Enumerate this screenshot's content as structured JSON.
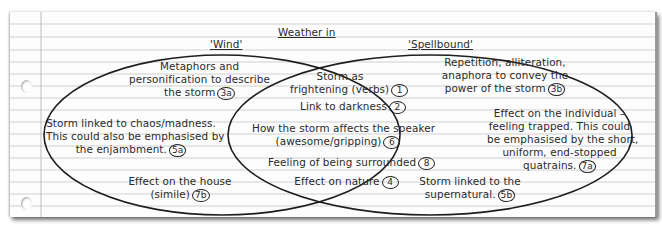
{
  "title": "Weather in",
  "sets": {
    "left": {
      "label": "'Wind'"
    },
    "right": {
      "label": "'Spellbound'"
    }
  },
  "left_only": [
    {
      "text_lines": [
        "Metaphors and",
        "personification to describe",
        "the storm"
      ],
      "badge": "3a"
    },
    {
      "text_lines": [
        "Storm linked to chaos/madness.",
        "This could also be emphasised by",
        "the enjambment."
      ],
      "badge": "5a"
    },
    {
      "text_lines": [
        "Effect on the house",
        "(simile)"
      ],
      "badge": "7b"
    }
  ],
  "overlap": [
    {
      "text_lines": [
        "Storm as",
        "frightening (verbs)"
      ],
      "badge": "1"
    },
    {
      "text_lines": [
        "Link to darkness"
      ],
      "badge": "2"
    },
    {
      "text_lines": [
        "How the storm affects the speaker",
        "(awesome/gripping)"
      ],
      "badge": "6"
    },
    {
      "text_lines": [
        "Feeling of being surrounded"
      ],
      "badge": "8"
    },
    {
      "text_lines": [
        "Effect on nature"
      ],
      "badge": "4"
    }
  ],
  "right_only": [
    {
      "text_lines": [
        "Repetition, alliteration,",
        "anaphora to convey the",
        "power of the storm"
      ],
      "badge": "3b"
    },
    {
      "text_lines": [
        "Effect on the individual –",
        "feeling trapped. This could",
        "be emphasised by the short,",
        "uniform, end-stopped",
        "quatrains."
      ],
      "badge": "7a"
    },
    {
      "text_lines": [
        "Storm linked to the",
        "supernatural."
      ],
      "badge": "5b"
    }
  ],
  "colors": {
    "ink": "#2a2a2a",
    "rule": "#c9c9c9",
    "margin": "#b8b8b8",
    "paper": "#fdfdfd"
  }
}
